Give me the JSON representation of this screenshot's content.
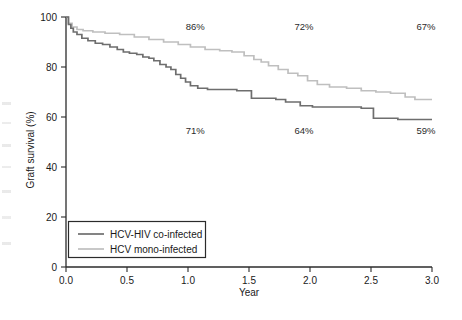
{
  "chart_data": {
    "type": "line",
    "title": "",
    "xlabel": "Year",
    "ylabel": "Graft survival (%)",
    "xlim": [
      0.0,
      3.0
    ],
    "ylim": [
      0,
      100
    ],
    "grid": false,
    "legend_position": "bottom-left",
    "xticks": [
      "0.0",
      "0.5",
      "1.0",
      "1.5",
      "2.0",
      "2.5",
      "3.0"
    ],
    "xtick_values": [
      0.0,
      0.5,
      1.0,
      1.5,
      2.0,
      2.5,
      3.0
    ],
    "yticks": [
      "0",
      "20",
      "40",
      "60",
      "80",
      "100"
    ],
    "ytick_values": [
      0,
      20,
      40,
      60,
      80,
      100
    ],
    "series": [
      {
        "name": "HCV-HIV co-infected",
        "color": "#6e6e6e",
        "style": "step",
        "points": [
          [
            0.0,
            100.0
          ],
          [
            0.02,
            97.0
          ],
          [
            0.04,
            95.5
          ],
          [
            0.06,
            94.0
          ],
          [
            0.09,
            93.0
          ],
          [
            0.13,
            91.5
          ],
          [
            0.18,
            90.5
          ],
          [
            0.24,
            89.5
          ],
          [
            0.3,
            89.0
          ],
          [
            0.36,
            88.0
          ],
          [
            0.42,
            87.0
          ],
          [
            0.47,
            86.0
          ],
          [
            0.52,
            85.5
          ],
          [
            0.58,
            85.0
          ],
          [
            0.63,
            84.0
          ],
          [
            0.68,
            83.5
          ],
          [
            0.72,
            82.5
          ],
          [
            0.77,
            81.0
          ],
          [
            0.82,
            80.0
          ],
          [
            0.86,
            79.0
          ],
          [
            0.9,
            77.0
          ],
          [
            0.94,
            75.5
          ],
          [
            0.98,
            74.0
          ],
          [
            1.02,
            72.5
          ],
          [
            1.08,
            71.5
          ],
          [
            1.16,
            71.0
          ],
          [
            1.3,
            71.0
          ],
          [
            1.4,
            70.5
          ],
          [
            1.52,
            67.5
          ],
          [
            1.72,
            67.0
          ],
          [
            1.8,
            66.0
          ],
          [
            1.92,
            64.5
          ],
          [
            2.02,
            64.0
          ],
          [
            2.3,
            64.0
          ],
          [
            2.42,
            63.5
          ],
          [
            2.52,
            59.5
          ],
          [
            2.72,
            59.0
          ],
          [
            3.0,
            59.0
          ]
        ]
      },
      {
        "name": "HCV mono-infected",
        "color": "#bfbfbf",
        "style": "step",
        "points": [
          [
            0.0,
            100.0
          ],
          [
            0.02,
            97.5
          ],
          [
            0.05,
            96.0
          ],
          [
            0.09,
            95.0
          ],
          [
            0.14,
            94.5
          ],
          [
            0.22,
            94.0
          ],
          [
            0.32,
            93.5
          ],
          [
            0.44,
            93.0
          ],
          [
            0.56,
            92.0
          ],
          [
            0.68,
            91.0
          ],
          [
            0.8,
            90.0
          ],
          [
            0.92,
            89.0
          ],
          [
            1.02,
            88.0
          ],
          [
            1.14,
            87.0
          ],
          [
            1.26,
            86.5
          ],
          [
            1.36,
            86.0
          ],
          [
            1.46,
            84.5
          ],
          [
            1.54,
            83.0
          ],
          [
            1.6,
            82.0
          ],
          [
            1.66,
            80.5
          ],
          [
            1.74,
            79.0
          ],
          [
            1.82,
            77.5
          ],
          [
            1.9,
            76.5
          ],
          [
            1.98,
            74.5
          ],
          [
            2.06,
            73.0
          ],
          [
            2.16,
            72.0
          ],
          [
            2.3,
            71.5
          ],
          [
            2.42,
            70.5
          ],
          [
            2.54,
            70.0
          ],
          [
            2.66,
            69.5
          ],
          [
            2.78,
            68.0
          ],
          [
            2.86,
            67.0
          ],
          [
            3.0,
            67.0
          ]
        ]
      }
    ],
    "annotations": [
      {
        "text": "86%",
        "x": 1.06,
        "y": 96.0,
        "series": "HCV mono-infected"
      },
      {
        "text": "72%",
        "x": 1.95,
        "y": 96.0,
        "series": "HCV mono-infected"
      },
      {
        "text": "67%",
        "x": 2.95,
        "y": 96.0,
        "series": "HCV mono-infected"
      },
      {
        "text": "71%",
        "x": 1.06,
        "y": 54.5,
        "series": "HCV-HIV co-infected"
      },
      {
        "text": "64%",
        "x": 1.95,
        "y": 54.5,
        "series": "HCV-HIV co-infected"
      },
      {
        "text": "59%",
        "x": 2.95,
        "y": 54.5,
        "series": "HCV-HIV co-infected"
      }
    ]
  },
  "legend": {
    "entries": [
      {
        "label": "HCV-HIV co-infected",
        "color": "#6e6e6e"
      },
      {
        "label": "HCV mono-infected",
        "color": "#bfbfbf"
      }
    ]
  },
  "axes": {
    "x_title": "Year",
    "y_title": "Graft survival (%)"
  }
}
